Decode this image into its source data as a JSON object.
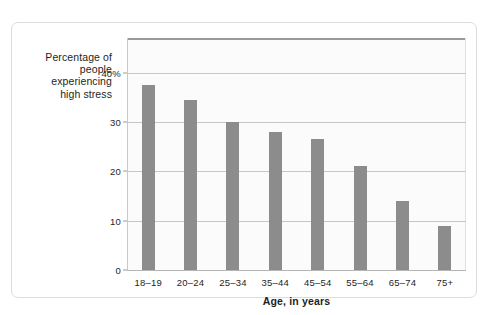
{
  "chart_data": {
    "type": "bar",
    "title": "",
    "xlabel": "Age, in years",
    "ylabel": "Percentage of people experiencing high stress",
    "ylabel_lines": [
      "Percentage of",
      "people",
      "experiencing",
      "high stress"
    ],
    "categories": [
      "18–19",
      "20–24",
      "25–34",
      "35–44",
      "45–54",
      "55–64",
      "65–74",
      "75+"
    ],
    "values": [
      37.5,
      34.5,
      30,
      28,
      26.5,
      21,
      14,
      9
    ],
    "ylim": [
      0,
      47
    ],
    "yticks": [
      0,
      10,
      20,
      30,
      40
    ],
    "ytick_labels": [
      "0",
      "10",
      "20",
      "30",
      "40%"
    ],
    "grid": true,
    "legend": false,
    "legend_position": "none",
    "series": [
      {
        "name": "Percentage of people experiencing high stress",
        "values": [
          37.5,
          34.5,
          30,
          28,
          26.5,
          21,
          14,
          9
        ]
      }
    ],
    "colors": {
      "bar": "#8c8c8c",
      "gridline": "#c7c7c7",
      "plot_background": "#fbfbfb",
      "axis_top_rule": "#9a9a9a",
      "card_border": "#dcdcdc",
      "text": "#1e1e1e"
    }
  }
}
